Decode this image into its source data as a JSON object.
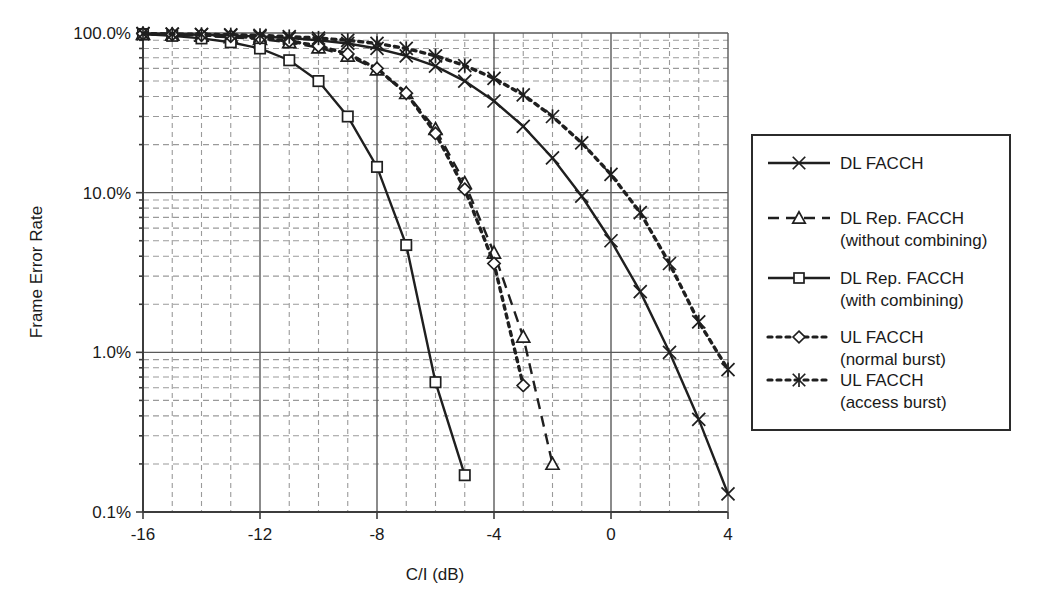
{
  "chart_data": {
    "type": "line",
    "title": "",
    "xlabel": "C/I (dB)",
    "ylabel": "Frame Error Rate",
    "xlim": [
      -16,
      4
    ],
    "ylim": [
      0.001,
      1.0
    ],
    "y_scale": "log",
    "grid": true,
    "x_major_ticks": [
      -16,
      -12,
      -8,
      -4,
      0,
      4
    ],
    "x_major_tick_labels": [
      "-16",
      "-12",
      "-8",
      "-4",
      "0",
      "4"
    ],
    "x_minor_tick_step": 1,
    "y_major_ticks": [
      1.0,
      0.1,
      0.01,
      0.001
    ],
    "y_major_tick_labels": [
      "100.0%",
      "10.0%",
      "1.0%",
      "0.1%"
    ],
    "legend_position": "right-outside",
    "series": [
      {
        "name": "DL FACCH",
        "label_lines": [
          "DL FACCH"
        ],
        "marker": "x-cross",
        "line_style": "solid",
        "color": "#1f1f1f",
        "x": [
          -16,
          -15,
          -14,
          -13,
          -12,
          -11,
          -10,
          -9,
          -8,
          -7,
          -6,
          -5,
          -4,
          -3,
          -2,
          -1,
          0,
          1,
          2,
          3,
          4
        ],
        "y": [
          0.99,
          0.985,
          0.975,
          0.965,
          0.95,
          0.93,
          0.9,
          0.86,
          0.8,
          0.72,
          0.62,
          0.5,
          0.375,
          0.26,
          0.165,
          0.095,
          0.05,
          0.024,
          0.01,
          0.0038,
          0.0013
        ]
      },
      {
        "name": "DL Rep. FACCH (without combining)",
        "label_lines": [
          "DL Rep. FACCH",
          "(without combining)"
        ],
        "marker": "triangle",
        "line_style": "dashed-long",
        "color": "#1f1f1f",
        "x": [
          -16,
          -15,
          -14,
          -13,
          -12,
          -11,
          -10,
          -9,
          -8,
          -7,
          -6,
          -5,
          -4,
          -3,
          -2
        ],
        "y": [
          0.985,
          0.975,
          0.96,
          0.94,
          0.915,
          0.875,
          0.81,
          0.72,
          0.59,
          0.42,
          0.25,
          0.115,
          0.042,
          0.0125,
          0.002
        ]
      },
      {
        "name": "DL Rep. FACCH (with combining)",
        "label_lines": [
          "DL Rep. FACCH",
          "(with combining)"
        ],
        "marker": "square",
        "line_style": "solid",
        "color": "#1f1f1f",
        "x": [
          -16,
          -15,
          -14,
          -13,
          -12,
          -11,
          -10,
          -9,
          -8,
          -7,
          -6,
          -5
        ],
        "y": [
          0.985,
          0.96,
          0.925,
          0.875,
          0.8,
          0.675,
          0.5,
          0.3,
          0.145,
          0.047,
          0.0065,
          0.0017
        ]
      },
      {
        "name": "UL FACCH (normal burst)",
        "label_lines": [
          "UL FACCH",
          "(normal burst)"
        ],
        "marker": "diamond",
        "line_style": "dotted",
        "color": "#1f1f1f",
        "x": [
          -16,
          -15,
          -14,
          -13,
          -12,
          -11,
          -10,
          -9,
          -8,
          -7,
          -6,
          -5,
          -4,
          -3
        ],
        "y": [
          0.99,
          0.98,
          0.97,
          0.955,
          0.93,
          0.89,
          0.83,
          0.74,
          0.6,
          0.42,
          0.235,
          0.105,
          0.036,
          0.0062
        ]
      },
      {
        "name": "UL FACCH (access burst)",
        "label_lines": [
          "UL FACCH",
          "(access burst)"
        ],
        "marker": "asterisk",
        "line_style": "dotted",
        "color": "#1f1f1f",
        "x": [
          -16,
          -15,
          -14,
          -13,
          -12,
          -11,
          -10,
          -9,
          -8,
          -7,
          -6,
          -5,
          -4,
          -3,
          -2,
          -1,
          0,
          1,
          2,
          3,
          4
        ],
        "y": [
          0.99,
          0.985,
          0.98,
          0.975,
          0.965,
          0.95,
          0.93,
          0.9,
          0.86,
          0.8,
          0.72,
          0.625,
          0.52,
          0.41,
          0.3,
          0.205,
          0.13,
          0.075,
          0.036,
          0.0155,
          0.0078
        ]
      }
    ]
  },
  "legend": {
    "items": [
      {
        "label_line1": "DL FACCH",
        "label_line2": ""
      },
      {
        "label_line1": "DL Rep. FACCH",
        "label_line2": "(without combining)"
      },
      {
        "label_line1": "DL Rep. FACCH",
        "label_line2": "(with combining)"
      },
      {
        "label_line1": "UL FACCH",
        "label_line2": "(normal burst)"
      },
      {
        "label_line1": "UL FACCH",
        "label_line2": "(access burst)"
      }
    ]
  },
  "axes": {
    "y_title": "Frame Error Rate",
    "x_title": "C/I (dB)",
    "y_labels": [
      "100.0%",
      "10.0%",
      "1.0%",
      "0.1%"
    ],
    "x_labels": [
      "-16",
      "-12",
      "-8",
      "-4",
      "0",
      "4"
    ]
  }
}
